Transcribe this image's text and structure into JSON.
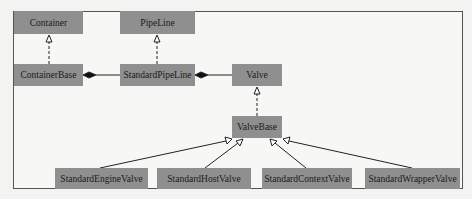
{
  "diagram": {
    "type": "uml-class-diagram",
    "nodes": {
      "container": "Container",
      "pipeline": "PipeLine",
      "container_base": "ContainerBase",
      "standard_pipeline": "StandardPipeLine",
      "valve": "Valve",
      "valve_base": "ValveBase",
      "standard_engine_valve": "StandardEngineValve",
      "standard_host_valve": "StandardHostValve",
      "standard_context_valve": "StandardContextValve",
      "standard_wrapper_valve": "StandardWrapperValve"
    },
    "edges": [
      {
        "from": "ContainerBase",
        "to": "Container",
        "kind": "realization"
      },
      {
        "from": "StandardPipeLine",
        "to": "PipeLine",
        "kind": "realization"
      },
      {
        "from": "StandardPipeLine",
        "to": "ContainerBase",
        "kind": "composition"
      },
      {
        "from": "Valve",
        "to": "StandardPipeLine",
        "kind": "composition"
      },
      {
        "from": "ValveBase",
        "to": "Valve",
        "kind": "realization"
      },
      {
        "from": "StandardEngineValve",
        "to": "ValveBase",
        "kind": "generalization"
      },
      {
        "from": "StandardHostValve",
        "to": "ValveBase",
        "kind": "generalization"
      },
      {
        "from": "StandardContextValve",
        "to": "ValveBase",
        "kind": "generalization"
      },
      {
        "from": "StandardWrapperValve",
        "to": "ValveBase",
        "kind": "generalization"
      }
    ],
    "colors": {
      "box_fill": "#8f8f8f",
      "line": "#222222",
      "background": "#f7f7f5"
    }
  }
}
